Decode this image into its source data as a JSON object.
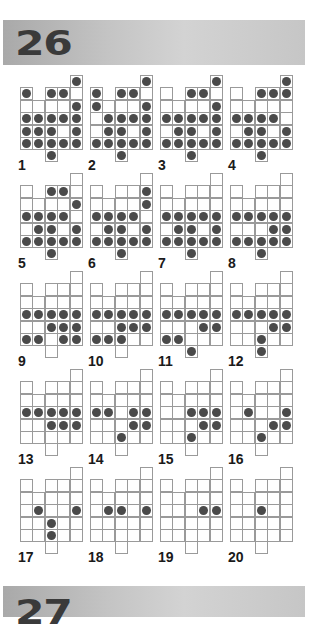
{
  "sections": [
    {
      "number": "26"
    },
    {
      "number": "27"
    }
  ],
  "shape": {
    "cells": [
      [
        0,
        4
      ],
      [
        1,
        0
      ],
      [
        1,
        2
      ],
      [
        1,
        3
      ],
      [
        1,
        4
      ],
      [
        2,
        0
      ],
      [
        2,
        1
      ],
      [
        2,
        2
      ],
      [
        2,
        3
      ],
      [
        2,
        4
      ],
      [
        3,
        0
      ],
      [
        3,
        1
      ],
      [
        3,
        2
      ],
      [
        3,
        3
      ],
      [
        3,
        4
      ],
      [
        4,
        0
      ],
      [
        4,
        1
      ],
      [
        4,
        2
      ],
      [
        4,
        3
      ],
      [
        4,
        4
      ],
      [
        5,
        0
      ],
      [
        5,
        1
      ],
      [
        5,
        2
      ],
      [
        5,
        3
      ],
      [
        5,
        4
      ],
      [
        6,
        2
      ]
    ]
  },
  "puzzles": [
    {
      "label": "1",
      "balls": [
        [
          0,
          4
        ],
        [
          1,
          0
        ],
        [
          1,
          2
        ],
        [
          1,
          3
        ],
        [
          2,
          4
        ],
        [
          3,
          0
        ],
        [
          3,
          1
        ],
        [
          3,
          2
        ],
        [
          3,
          3
        ],
        [
          3,
          4
        ],
        [
          4,
          0
        ],
        [
          4,
          1
        ],
        [
          4,
          2
        ],
        [
          4,
          4
        ],
        [
          5,
          0
        ],
        [
          5,
          1
        ],
        [
          5,
          2
        ],
        [
          5,
          3
        ],
        [
          5,
          4
        ],
        [
          6,
          2
        ]
      ]
    },
    {
      "label": "2",
      "balls": [
        [
          0,
          4
        ],
        [
          1,
          0
        ],
        [
          1,
          2
        ],
        [
          1,
          3
        ],
        [
          2,
          0
        ],
        [
          2,
          4
        ],
        [
          3,
          1
        ],
        [
          3,
          2
        ],
        [
          3,
          3
        ],
        [
          3,
          4
        ],
        [
          4,
          1
        ],
        [
          4,
          2
        ],
        [
          4,
          4
        ],
        [
          5,
          0
        ],
        [
          5,
          1
        ],
        [
          5,
          2
        ],
        [
          5,
          3
        ],
        [
          5,
          4
        ],
        [
          6,
          2
        ]
      ]
    },
    {
      "label": "3",
      "balls": [
        [
          0,
          4
        ],
        [
          1,
          2
        ],
        [
          1,
          3
        ],
        [
          2,
          4
        ],
        [
          3,
          0
        ],
        [
          3,
          1
        ],
        [
          3,
          2
        ],
        [
          3,
          3
        ],
        [
          3,
          4
        ],
        [
          4,
          1
        ],
        [
          4,
          2
        ],
        [
          4,
          4
        ],
        [
          5,
          0
        ],
        [
          5,
          1
        ],
        [
          5,
          2
        ],
        [
          5,
          3
        ],
        [
          5,
          4
        ],
        [
          6,
          2
        ]
      ]
    },
    {
      "label": "4",
      "balls": [
        [
          0,
          4
        ],
        [
          1,
          2
        ],
        [
          1,
          3
        ],
        [
          1,
          4
        ],
        [
          3,
          0
        ],
        [
          3,
          1
        ],
        [
          3,
          2
        ],
        [
          3,
          3
        ],
        [
          4,
          1
        ],
        [
          4,
          2
        ],
        [
          4,
          4
        ],
        [
          5,
          0
        ],
        [
          5,
          1
        ],
        [
          5,
          2
        ],
        [
          5,
          3
        ],
        [
          5,
          4
        ],
        [
          6,
          2
        ]
      ]
    },
    {
      "label": "5",
      "balls": [
        [
          1,
          2
        ],
        [
          1,
          3
        ],
        [
          2,
          4
        ],
        [
          3,
          0
        ],
        [
          3,
          1
        ],
        [
          3,
          2
        ],
        [
          3,
          3
        ],
        [
          4,
          1
        ],
        [
          4,
          2
        ],
        [
          4,
          4
        ],
        [
          5,
          0
        ],
        [
          5,
          1
        ],
        [
          5,
          2
        ],
        [
          5,
          3
        ],
        [
          5,
          4
        ],
        [
          6,
          2
        ]
      ]
    },
    {
      "label": "6",
      "balls": [
        [
          1,
          4
        ],
        [
          2,
          4
        ],
        [
          3,
          0
        ],
        [
          3,
          1
        ],
        [
          3,
          2
        ],
        [
          3,
          3
        ],
        [
          4,
          1
        ],
        [
          4,
          2
        ],
        [
          4,
          4
        ],
        [
          5,
          0
        ],
        [
          5,
          1
        ],
        [
          5,
          2
        ],
        [
          5,
          3
        ],
        [
          5,
          4
        ],
        [
          6,
          2
        ]
      ]
    },
    {
      "label": "7",
      "balls": [
        [
          3,
          0
        ],
        [
          3,
          1
        ],
        [
          3,
          2
        ],
        [
          3,
          3
        ],
        [
          3,
          4
        ],
        [
          4,
          1
        ],
        [
          4,
          2
        ],
        [
          4,
          4
        ],
        [
          5,
          0
        ],
        [
          5,
          1
        ],
        [
          5,
          2
        ],
        [
          5,
          3
        ],
        [
          5,
          4
        ],
        [
          6,
          2
        ]
      ]
    },
    {
      "label": "8",
      "balls": [
        [
          3,
          0
        ],
        [
          3,
          1
        ],
        [
          3,
          2
        ],
        [
          3,
          3
        ],
        [
          3,
          4
        ],
        [
          4,
          3
        ],
        [
          4,
          4
        ],
        [
          5,
          0
        ],
        [
          5,
          1
        ],
        [
          5,
          2
        ],
        [
          5,
          3
        ],
        [
          5,
          4
        ],
        [
          6,
          2
        ]
      ]
    },
    {
      "label": "9",
      "balls": [
        [
          3,
          0
        ],
        [
          3,
          1
        ],
        [
          3,
          2
        ],
        [
          3,
          3
        ],
        [
          3,
          4
        ],
        [
          4,
          2
        ],
        [
          4,
          3
        ],
        [
          4,
          4
        ],
        [
          5,
          0
        ],
        [
          5,
          1
        ],
        [
          5,
          3
        ],
        [
          5,
          4
        ]
      ]
    },
    {
      "label": "10",
      "balls": [
        [
          3,
          0
        ],
        [
          3,
          1
        ],
        [
          3,
          2
        ],
        [
          3,
          3
        ],
        [
          3,
          4
        ],
        [
          4,
          2
        ],
        [
          4,
          3
        ],
        [
          4,
          4
        ],
        [
          5,
          0
        ],
        [
          5,
          1
        ],
        [
          5,
          2
        ]
      ]
    },
    {
      "label": "11",
      "balls": [
        [
          3,
          0
        ],
        [
          3,
          1
        ],
        [
          3,
          2
        ],
        [
          3,
          3
        ],
        [
          3,
          4
        ],
        [
          4,
          3
        ],
        [
          4,
          4
        ],
        [
          5,
          0
        ],
        [
          5,
          1
        ],
        [
          6,
          2
        ]
      ]
    },
    {
      "label": "12",
      "balls": [
        [
          3,
          0
        ],
        [
          3,
          1
        ],
        [
          3,
          2
        ],
        [
          3,
          3
        ],
        [
          3,
          4
        ],
        [
          4,
          3
        ],
        [
          4,
          4
        ],
        [
          5,
          2
        ],
        [
          6,
          2
        ]
      ]
    },
    {
      "label": "13",
      "balls": [
        [
          3,
          0
        ],
        [
          3,
          1
        ],
        [
          3,
          2
        ],
        [
          3,
          3
        ],
        [
          3,
          4
        ],
        [
          4,
          2
        ],
        [
          4,
          3
        ],
        [
          4,
          4
        ]
      ]
    },
    {
      "label": "14",
      "balls": [
        [
          3,
          0
        ],
        [
          3,
          1
        ],
        [
          3,
          3
        ],
        [
          3,
          4
        ],
        [
          4,
          3
        ],
        [
          4,
          4
        ],
        [
          5,
          2
        ]
      ]
    },
    {
      "label": "15",
      "balls": [
        [
          3,
          2
        ],
        [
          3,
          3
        ],
        [
          3,
          4
        ],
        [
          4,
          3
        ],
        [
          4,
          4
        ],
        [
          5,
          2
        ]
      ]
    },
    {
      "label": "16",
      "balls": [
        [
          3,
          1
        ],
        [
          3,
          4
        ],
        [
          4,
          3
        ],
        [
          4,
          4
        ],
        [
          5,
          2
        ]
      ]
    },
    {
      "label": "17",
      "balls": [
        [
          3,
          1
        ],
        [
          3,
          4
        ],
        [
          4,
          2
        ],
        [
          5,
          2
        ]
      ]
    },
    {
      "label": "18",
      "balls": [
        [
          3,
          1
        ],
        [
          3,
          2
        ],
        [
          3,
          4
        ]
      ]
    },
    {
      "label": "19",
      "balls": [
        [
          3,
          3
        ],
        [
          3,
          4
        ]
      ]
    },
    {
      "label": "20",
      "balls": [
        [
          3,
          2
        ]
      ]
    }
  ],
  "colors": {
    "ball": "#4a4a4a",
    "grid_line": "#9a9a9a",
    "band": "#bdbdbd"
  }
}
